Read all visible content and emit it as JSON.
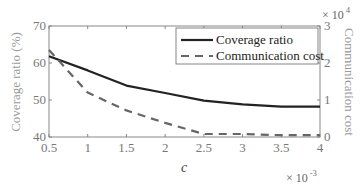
{
  "chart_data": {
    "type": "line",
    "title": "",
    "xlabel": "c",
    "x_multiplier": "× 10",
    "x_multiplier_exp": "-3",
    "ylabel_left": "Coverage ratio (%)",
    "ylabel_right": "Communication cost",
    "y_right_multiplier": "× 10",
    "y_right_multiplier_exp": "4",
    "x": [
      0.5,
      1,
      1.5,
      2,
      2.5,
      3,
      3.5,
      4
    ],
    "x_ticks": [
      "0.5",
      "1",
      "1.5",
      "2",
      "2.5",
      "3",
      "3.5",
      "4"
    ],
    "xlim": [
      0.5,
      4
    ],
    "ylim_left": [
      40,
      70
    ],
    "y_left_ticks": [
      "40",
      "50",
      "60",
      "70"
    ],
    "ylim_right": [
      0,
      3
    ],
    "y_right_ticks": [
      "0",
      "1",
      "2",
      "3"
    ],
    "grid": false,
    "legend_position": "upper right",
    "series": [
      {
        "name": "Coverage ratio",
        "axis": "left",
        "style": "solid",
        "color": "#222222",
        "values": [
          61.8,
          58.0,
          53.9,
          51.9,
          49.8,
          48.8,
          48.2,
          48.2
        ]
      },
      {
        "name": "Communication cost",
        "axis": "right",
        "style": "dashed",
        "color": "#666666",
        "values": [
          2.35,
          1.2,
          0.72,
          0.38,
          0.08,
          0.08,
          0.05,
          0.05
        ]
      }
    ]
  }
}
